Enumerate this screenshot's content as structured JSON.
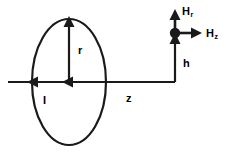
{
  "figure": {
    "kind": "physics-diagram",
    "stroke_color": "#1a1a1a",
    "background_color": "#ffffff"
  },
  "labels": {
    "radius": "r",
    "current": "I",
    "axial_distance": "z",
    "height": "h",
    "field_radial": {
      "base": "H",
      "sub": "r"
    },
    "field_axial": {
      "base": "H",
      "sub": "z"
    }
  },
  "geometry": {
    "loop": {
      "center_x": 69,
      "center_y": 82,
      "radius_x": 37,
      "radius_y": 63
    },
    "axis_line": {
      "x1": 8,
      "y1": 82,
      "x2": 175,
      "y2": 82
    },
    "radius_arrow": {
      "x": 69,
      "y1": 82,
      "y2": 20
    },
    "current_arrow": {
      "x": 33,
      "y": 82
    },
    "center_arrow": {
      "x": 69,
      "y": 82
    },
    "height_line": {
      "x": 175,
      "y1": 82,
      "y2": 36
    },
    "field_point": {
      "x": 175,
      "y": 33,
      "dot_radius": 5
    },
    "hr_arrow": {
      "x": 175,
      "y1": 30,
      "y2": 11
    },
    "hz_arrow": {
      "y": 33,
      "x1": 178,
      "x2": 202
    }
  },
  "icons": {
    "field_point": "filled-circle-icon",
    "arrow": "arrowhead-icon"
  }
}
